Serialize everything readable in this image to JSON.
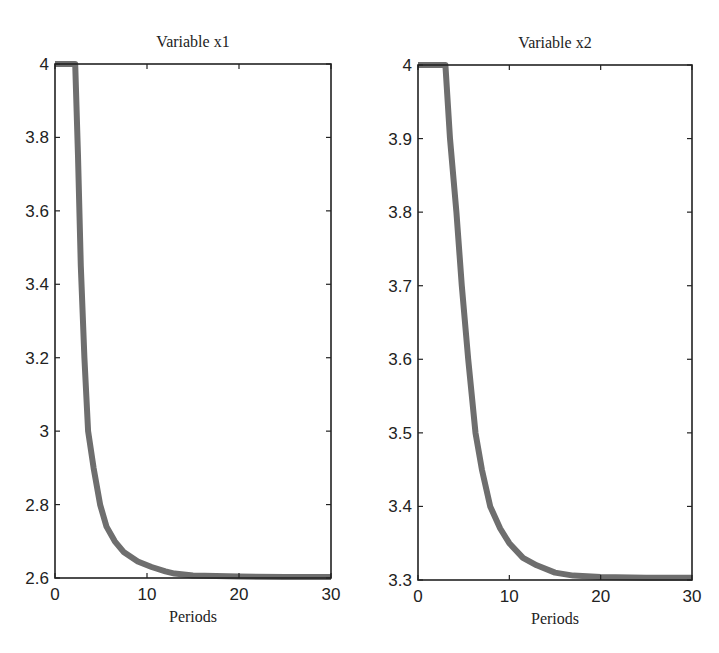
{
  "chart_data": [
    {
      "type": "line",
      "title": "Variable x1",
      "xlabel": "Periods",
      "ylabel": "",
      "xlim": [
        0,
        30
      ],
      "ylim": [
        2.6,
        4
      ],
      "xticks": [
        "0",
        "10",
        "20",
        "30"
      ],
      "yticks": [
        "2.6",
        "2.8",
        "3",
        "3.2",
        "3.4",
        "3.6",
        "3.8",
        "4"
      ],
      "grid": false,
      "line_color": "#6e6e6e",
      "x": [
        0,
        2.2,
        2.5,
        2.8,
        3.2,
        3.6,
        4.2,
        4.9,
        5.6,
        6.5,
        7.5,
        9,
        10.5,
        12,
        13,
        15,
        20,
        25,
        30
      ],
      "values": [
        4.0,
        4.0,
        3.75,
        3.45,
        3.2,
        3.0,
        2.9,
        2.8,
        2.74,
        2.7,
        2.67,
        2.645,
        2.63,
        2.618,
        2.612,
        2.607,
        2.604,
        2.603,
        2.603
      ]
    },
    {
      "type": "line",
      "title": "Variable x2",
      "xlabel": "Periods",
      "ylabel": "",
      "xlim": [
        0,
        30
      ],
      "ylim": [
        3.3,
        4
      ],
      "xticks": [
        "0",
        "10",
        "20",
        "30"
      ],
      "yticks": [
        "3.3",
        "3.4",
        "3.5",
        "3.6",
        "3.7",
        "3.8",
        "3.9",
        "4"
      ],
      "grid": false,
      "line_color": "#6e6e6e",
      "x": [
        0,
        3.0,
        3.5,
        4.2,
        4.8,
        5.5,
        6.3,
        7.0,
        7.9,
        9,
        10,
        11.5,
        13,
        15,
        17,
        20,
        25,
        30
      ],
      "values": [
        4.0,
        4.0,
        3.9,
        3.8,
        3.7,
        3.6,
        3.5,
        3.45,
        3.4,
        3.37,
        3.35,
        3.33,
        3.32,
        3.31,
        3.306,
        3.304,
        3.303,
        3.303
      ]
    }
  ]
}
